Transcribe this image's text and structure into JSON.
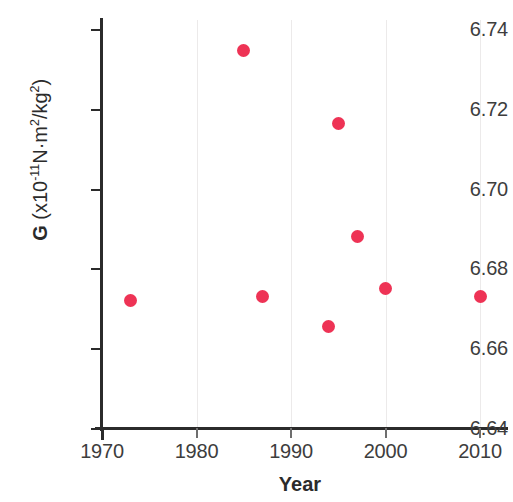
{
  "chart_data": {
    "type": "scatter",
    "title": "",
    "xlabel": "Year",
    "ylabel": "G (x10⁻¹¹N·m²/kg²)",
    "ylabel_parts": {
      "symbol": "G",
      "open": " (x10",
      "exponent": "-11",
      "units": "N·m",
      "unit_exp_1": "2",
      "slash": "/kg",
      "unit_exp_2": "2",
      "close": ")"
    },
    "xlim": [
      1968,
      2013
    ],
    "ylim": [
      6.64,
      6.745
    ],
    "grid": "vertical-only",
    "legend": "none",
    "marker_color": "#ee3355",
    "axis_color": "#2b2b2b",
    "gridline_color": "#eceaea",
    "xticks": [
      "1970",
      "1980",
      "1990",
      "2000",
      "2010"
    ],
    "xtick_values": [
      1970,
      1980,
      1990,
      2000,
      2010
    ],
    "yticks": [
      "6.74",
      "6.72",
      "6.70",
      "6.68",
      "6.66",
      "6.64"
    ],
    "ytick_values": [
      6.74,
      6.72,
      6.7,
      6.68,
      6.66,
      6.64
    ],
    "points": [
      {
        "x": 1973,
        "y": 6.672
      },
      {
        "x": 1985,
        "y": 6.7345
      },
      {
        "x": 1987,
        "y": 6.673
      },
      {
        "x": 1994,
        "y": 6.6655
      },
      {
        "x": 1995,
        "y": 6.7162
      },
      {
        "x": 1997,
        "y": 6.688
      },
      {
        "x": 2000,
        "y": 6.675
      },
      {
        "x": 2010,
        "y": 6.673
      }
    ]
  }
}
